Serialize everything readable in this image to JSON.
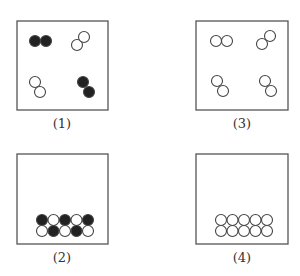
{
  "figure": {
    "colors": {
      "frame": "#555555",
      "filled": "#222222",
      "hollow_fill": "#ffffff",
      "stroke": "#444444"
    },
    "particle_radius": 5.5,
    "panels": [
      {
        "id": "1",
        "label": "(1)",
        "box": {
          "x": 17,
          "y": 21,
          "w": 91,
          "h": 89
        },
        "label_pos": {
          "x": 62,
          "y": 128
        },
        "description": "gas of diatomic molecules: two filled, two hollow",
        "particles": [
          {
            "cx": 35,
            "cy": 41,
            "type": "filled"
          },
          {
            "cx": 46,
            "cy": 41,
            "type": "filled"
          },
          {
            "cx": 77,
            "cy": 45,
            "type": "hollow"
          },
          {
            "cx": 84,
            "cy": 37,
            "type": "hollow"
          },
          {
            "cx": 35,
            "cy": 82,
            "type": "hollow"
          },
          {
            "cx": 40,
            "cy": 92,
            "type": "hollow"
          },
          {
            "cx": 83,
            "cy": 82,
            "type": "filled"
          },
          {
            "cx": 89,
            "cy": 92,
            "type": "filled"
          }
        ]
      },
      {
        "id": "3",
        "label": "(3)",
        "box": {
          "x": 196,
          "y": 21,
          "w": 92,
          "h": 89
        },
        "label_pos": {
          "x": 242,
          "y": 128
        },
        "description": "gas of diatomic molecules: all hollow",
        "particles": [
          {
            "cx": 216,
            "cy": 41,
            "type": "hollow"
          },
          {
            "cx": 227,
            "cy": 41,
            "type": "hollow"
          },
          {
            "cx": 262,
            "cy": 44,
            "type": "hollow"
          },
          {
            "cx": 270,
            "cy": 36,
            "type": "hollow"
          },
          {
            "cx": 217,
            "cy": 81,
            "type": "hollow"
          },
          {
            "cx": 223,
            "cy": 91,
            "type": "hollow"
          },
          {
            "cx": 265,
            "cy": 81,
            "type": "hollow"
          },
          {
            "cx": 271,
            "cy": 91,
            "type": "hollow"
          }
        ]
      },
      {
        "id": "2",
        "label": "(2)",
        "box": {
          "x": 17,
          "y": 154,
          "w": 91,
          "h": 90
        },
        "label_pos": {
          "x": 62,
          "y": 262
        },
        "description": "solid lattice: alternating filled and hollow particles",
        "particles": [
          {
            "cx": 42,
            "cy": 220,
            "type": "filled"
          },
          {
            "cx": 53.5,
            "cy": 220,
            "type": "hollow"
          },
          {
            "cx": 65,
            "cy": 220,
            "type": "filled"
          },
          {
            "cx": 76.5,
            "cy": 220,
            "type": "hollow"
          },
          {
            "cx": 88,
            "cy": 220,
            "type": "filled"
          },
          {
            "cx": 42,
            "cy": 231,
            "type": "hollow"
          },
          {
            "cx": 53.5,
            "cy": 231,
            "type": "filled"
          },
          {
            "cx": 65,
            "cy": 231,
            "type": "hollow"
          },
          {
            "cx": 76.5,
            "cy": 231,
            "type": "filled"
          },
          {
            "cx": 88,
            "cy": 231,
            "type": "hollow"
          }
        ]
      },
      {
        "id": "4",
        "label": "(4)",
        "box": {
          "x": 196,
          "y": 154,
          "w": 92,
          "h": 90
        },
        "label_pos": {
          "x": 242,
          "y": 262
        },
        "description": "solid lattice: all hollow particles",
        "particles": [
          {
            "cx": 221,
            "cy": 220,
            "type": "hollow"
          },
          {
            "cx": 232.5,
            "cy": 220,
            "type": "hollow"
          },
          {
            "cx": 244,
            "cy": 220,
            "type": "hollow"
          },
          {
            "cx": 255.5,
            "cy": 220,
            "type": "hollow"
          },
          {
            "cx": 267,
            "cy": 220,
            "type": "hollow"
          },
          {
            "cx": 221,
            "cy": 231,
            "type": "hollow"
          },
          {
            "cx": 232.5,
            "cy": 231,
            "type": "hollow"
          },
          {
            "cx": 244,
            "cy": 231,
            "type": "hollow"
          },
          {
            "cx": 255.5,
            "cy": 231,
            "type": "hollow"
          },
          {
            "cx": 267,
            "cy": 231,
            "type": "hollow"
          }
        ]
      }
    ]
  }
}
